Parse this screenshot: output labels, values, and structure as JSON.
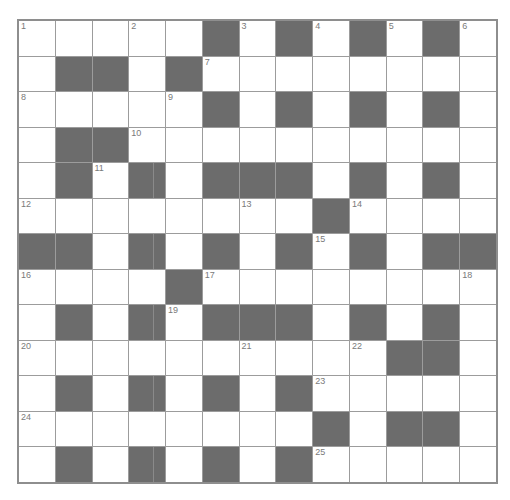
{
  "puzzle": {
    "rows": 13,
    "cols": 13,
    "colors": {
      "block": "#6c6c6c",
      "cell": "#ffffff",
      "gridline": "#9c9c9c",
      "border": "#8e8e8e",
      "number": "#7a7a7a"
    },
    "layout": [
      "WWWWWBWBWBWBW",
      "WBBWBWWWWWWWW",
      "WWWWWBWBWBWBW",
      "WBBWWWWWWWWWW",
      "WBWBWBBBWBWBW",
      "WWWWWWWWBWWWW",
      "BBWBWBWBWBWBB",
      "WWWWBWWWWWWWW",
      "WBWBWBBBWBWBW",
      "WWWWWWWWWWBBW",
      "WBWBWBWBWWWWW",
      "WWWWWWWWBWBBW",
      "WBWBWBWBWWWWW"
    ],
    "numbers": [
      {
        "row": 0,
        "col": 0,
        "n": "1"
      },
      {
        "row": 0,
        "col": 3,
        "n": "2"
      },
      {
        "row": 0,
        "col": 6,
        "n": "3"
      },
      {
        "row": 0,
        "col": 8,
        "n": "4"
      },
      {
        "row": 0,
        "col": 10,
        "n": "5"
      },
      {
        "row": 0,
        "col": 12,
        "n": "6"
      },
      {
        "row": 1,
        "col": 5,
        "n": "7"
      },
      {
        "row": 2,
        "col": 0,
        "n": "8"
      },
      {
        "row": 2,
        "col": 4,
        "n": "9"
      },
      {
        "row": 3,
        "col": 3,
        "n": "10"
      },
      {
        "row": 4,
        "col": 2,
        "n": "11"
      },
      {
        "row": 5,
        "col": 0,
        "n": "12"
      },
      {
        "row": 5,
        "col": 6,
        "n": "13"
      },
      {
        "row": 5,
        "col": 9,
        "n": "14"
      },
      {
        "row": 6,
        "col": 8,
        "n": "15"
      },
      {
        "row": 7,
        "col": 0,
        "n": "16"
      },
      {
        "row": 7,
        "col": 5,
        "n": "17"
      },
      {
        "row": 7,
        "col": 12,
        "n": "18"
      },
      {
        "row": 8,
        "col": 4,
        "n": "19"
      },
      {
        "row": 9,
        "col": 0,
        "n": "20"
      },
      {
        "row": 9,
        "col": 6,
        "n": "21"
      },
      {
        "row": 9,
        "col": 9,
        "n": "22"
      },
      {
        "row": 10,
        "col": 8,
        "n": "23"
      },
      {
        "row": 11,
        "col": 0,
        "n": "24"
      },
      {
        "row": 12,
        "col": 8,
        "n": "25"
      }
    ],
    "split_block_column": 3
  }
}
